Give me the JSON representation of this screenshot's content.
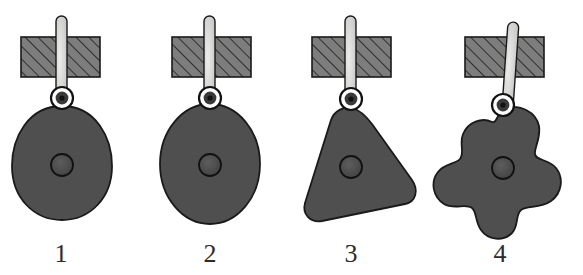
{
  "figure": {
    "background_color": "#ffffff",
    "width": 583,
    "height": 275,
    "colors": {
      "body_fill": "#4f4f4f",
      "body_stroke": "#1a1a1a",
      "block_fill": "#7d7d7d",
      "block_stroke": "#1a1a1a",
      "hatch_stroke": "#1a1a1a",
      "rod_fill": "#d2d2d2",
      "rod_stroke": "#1a1a1a",
      "pivot_outer_fill": "#ffffff",
      "pivot_outer_stroke": "#111111",
      "pivot_inner_fill": "#3a3a3a",
      "center_dot_fill": "#474747",
      "center_dot_stroke": "#111111",
      "label_color": "#2b2b2b"
    },
    "panels": [
      {
        "id": "panel-1",
        "label": "1",
        "label_x": 61,
        "label_y": 262,
        "shape_name": "egg-teardrop-body",
        "shape_description": "egg / teardrop shaped rigid body",
        "block": {
          "x": 21,
          "y": 37,
          "width": 79,
          "height": 40
        },
        "rod": {
          "x": 56,
          "top": 16,
          "bottom": 94,
          "width": 10,
          "tilt_deg": 0
        },
        "pivot": {
          "cx": 62,
          "cy": 98,
          "r_outer": 11,
          "r_mid": 8,
          "r_inner": 3.4
        },
        "center_dot": {
          "cx": 62,
          "cy": 165,
          "r": 11
        }
      },
      {
        "id": "panel-2",
        "label": "2",
        "label_x": 210,
        "label_y": 262,
        "shape_name": "ellipse-body",
        "shape_description": "vertical ellipse rigid body",
        "block": {
          "x": 172,
          "y": 37,
          "width": 79,
          "height": 40
        },
        "rod": {
          "x": 205,
          "top": 16,
          "bottom": 94,
          "width": 10,
          "tilt_deg": 0
        },
        "pivot": {
          "cx": 210,
          "cy": 98,
          "r_outer": 11,
          "r_mid": 8,
          "r_inner": 3.4
        },
        "center_dot": {
          "cx": 210,
          "cy": 165,
          "r": 11
        }
      },
      {
        "id": "panel-3",
        "label": "3",
        "label_x": 351,
        "label_y": 262,
        "shape_name": "rounded-triangle-body",
        "shape_description": "rounded triangular rigid body",
        "block": {
          "x": 312,
          "y": 37,
          "width": 79,
          "height": 40
        },
        "rod": {
          "x": 346,
          "top": 16,
          "bottom": 94,
          "width": 10,
          "tilt_deg": 0
        },
        "pivot": {
          "cx": 351,
          "cy": 99,
          "r_outer": 11,
          "r_mid": 8,
          "r_inner": 3.4
        },
        "center_dot": {
          "cx": 351,
          "cy": 167,
          "r": 11
        }
      },
      {
        "id": "panel-4",
        "label": "4",
        "label_x": 500,
        "label_y": 262,
        "shape_name": "blob-lobed-body",
        "shape_description": "irregular four-lobed blob rigid body",
        "block": {
          "x": 465,
          "y": 37,
          "width": 79,
          "height": 40
        },
        "rod": {
          "x": 508,
          "top": 26,
          "bottom": 99,
          "width": 10,
          "tilt_deg": 4
        },
        "pivot": {
          "cx": 503,
          "cy": 105,
          "r_outer": 11,
          "r_mid": 8,
          "r_inner": 3.4
        },
        "center_dot": {
          "cx": 503,
          "cy": 168,
          "r": 11
        }
      }
    ]
  }
}
